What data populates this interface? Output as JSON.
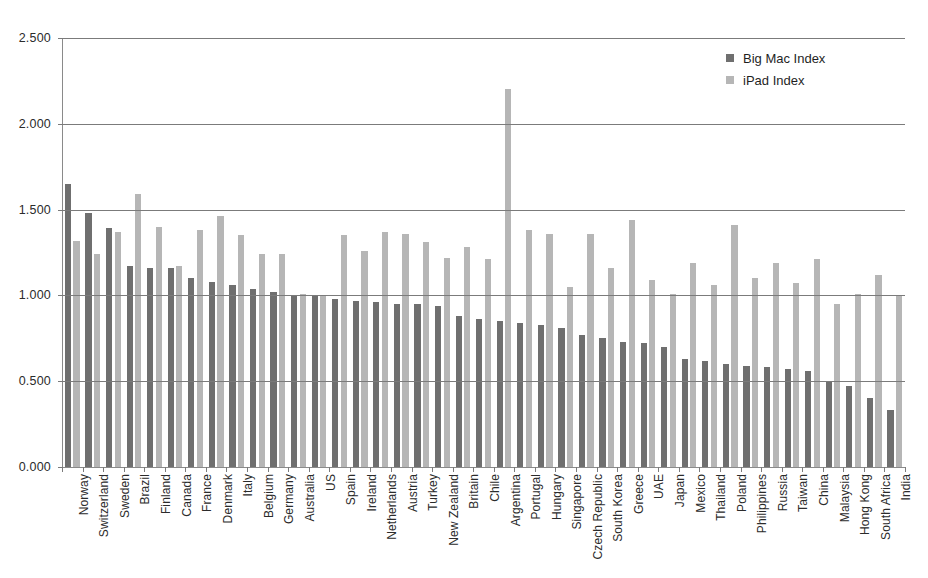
{
  "chart_data": {
    "type": "bar",
    "title": "",
    "xlabel": "",
    "ylabel": "",
    "ylim": [
      0,
      2.5
    ],
    "ytick_labels": [
      "0.000",
      "0.500",
      "1.000",
      "1.500",
      "2.000",
      "2.500"
    ],
    "ytick_values": [
      0,
      0.5,
      1.0,
      1.5,
      2.0,
      2.5
    ],
    "grid": true,
    "legend_position": "top-right",
    "categories": [
      "Norway",
      "Switzerland",
      "Sweden",
      "Brazil",
      "Finland",
      "Canada",
      "France",
      "Denmark",
      "Italy",
      "Belgium",
      "Germany",
      "Australia",
      "US",
      "Spain",
      "Ireland",
      "Netherlands",
      "Austria",
      "Turkey",
      "New Zealand",
      "Britain",
      "Chile",
      "Argentina",
      "Portugal",
      "Hungary",
      "Singapore",
      "Czech Republic",
      "South Korea",
      "Greece",
      "UAE",
      "Japan",
      "Mexico",
      "Thailand",
      "Poland",
      "Philippines",
      "Russia",
      "Taiwan",
      "China",
      "Malaysia",
      "Hong Kong",
      "South Africa",
      "India"
    ],
    "series": [
      {
        "name": "Big Mac Index",
        "color": "#6f6f6f",
        "values": [
          1.65,
          1.48,
          1.39,
          1.17,
          1.16,
          1.16,
          1.1,
          1.08,
          1.06,
          1.04,
          1.02,
          1.0,
          1.0,
          0.98,
          0.97,
          0.96,
          0.95,
          0.95,
          0.94,
          0.88,
          0.86,
          0.85,
          0.84,
          0.83,
          0.81,
          0.77,
          0.75,
          0.73,
          0.72,
          0.7,
          0.63,
          0.62,
          0.6,
          0.59,
          0.58,
          0.57,
          0.56,
          0.5,
          0.47,
          0.4,
          0.33
        ]
      },
      {
        "name": "iPad Index",
        "color": "#b6b6b6",
        "values": [
          1.32,
          1.24,
          1.37,
          1.59,
          1.4,
          1.17,
          1.38,
          1.46,
          1.35,
          1.24,
          1.24,
          1.01,
          1.0,
          1.35,
          1.26,
          1.37,
          1.36,
          1.31,
          1.22,
          1.28,
          1.21,
          2.2,
          1.38,
          1.36,
          1.05,
          1.36,
          1.16,
          1.44,
          1.09,
          1.01,
          1.19,
          1.06,
          1.41,
          1.1,
          1.19,
          1.07,
          1.21,
          0.95,
          1.01,
          1.12,
          1.0
        ]
      }
    ]
  },
  "legend": {
    "items": [
      {
        "label": "Big Mac Index",
        "swatch": "big-mac"
      },
      {
        "label": "iPad Index",
        "swatch": "ipad"
      }
    ]
  }
}
